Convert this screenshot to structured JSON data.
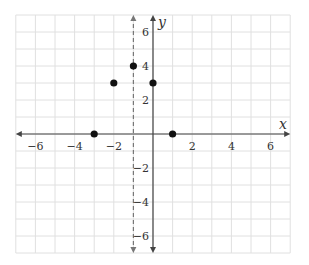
{
  "chart_data": {
    "type": "scatter",
    "title": "",
    "xlabel": "x",
    "ylabel": "y",
    "xlim": [
      -7,
      7
    ],
    "ylim": [
      -7,
      7
    ],
    "grid": true,
    "x_ticks": [
      -6,
      -4,
      -2,
      2,
      4,
      6
    ],
    "y_ticks": [
      -6,
      -4,
      -2,
      2,
      4,
      6
    ],
    "x_tick_labels": [
      "−6",
      "−4",
      "−2",
      "2",
      "4",
      "6"
    ],
    "y_tick_labels": [
      "−6",
      "−4",
      "−2",
      "2",
      "4",
      "6"
    ],
    "points": [
      {
        "x": -3,
        "y": 0
      },
      {
        "x": -2,
        "y": 3
      },
      {
        "x": -1,
        "y": 4
      },
      {
        "x": 0,
        "y": 3
      },
      {
        "x": 1,
        "y": 0
      }
    ],
    "annotations": [
      {
        "type": "dashed_vertical_line",
        "x": -1,
        "label": "axis of symmetry x = −1"
      }
    ],
    "colors": {
      "grid": "#e0e0e0",
      "axis": "#444444",
      "points": "#111111",
      "dashed_line": "#777777"
    }
  }
}
